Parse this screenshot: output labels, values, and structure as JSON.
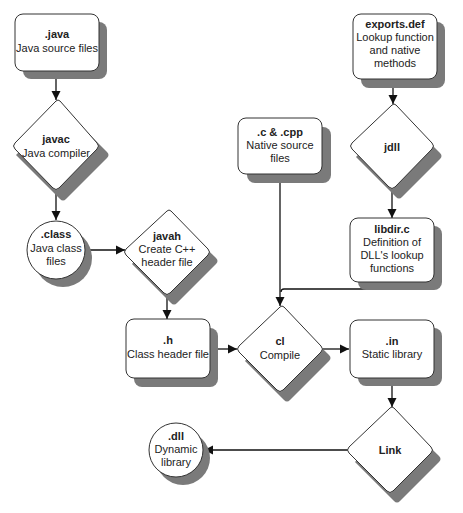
{
  "diagram": {
    "type": "flowchart",
    "colors": {
      "shape_fill": "#ffffff",
      "shape_stroke": "#333333",
      "shadow": "#7a7a7a",
      "edge": "#111111",
      "text": "#222222"
    },
    "nodes": {
      "java": {
        "shape": "rounded-rect",
        "title": ".java",
        "lines": [
          "Java source files"
        ]
      },
      "javac": {
        "shape": "diamond",
        "title": "javac",
        "lines": [
          "Java compiler"
        ]
      },
      "class": {
        "shape": "circle",
        "title": ".class",
        "lines": [
          "Java class",
          "files"
        ]
      },
      "javah": {
        "shape": "diamond",
        "title": "javah",
        "lines": [
          "Create C++",
          "header file"
        ]
      },
      "h": {
        "shape": "rounded-rect",
        "title": ".h",
        "lines": [
          "Class header file"
        ]
      },
      "cpp": {
        "shape": "rounded-rect",
        "title": ".c & .cpp",
        "lines": [
          "Native source",
          "files"
        ]
      },
      "exports": {
        "shape": "rounded-rect",
        "title": "exports.def",
        "lines": [
          "Lookup function",
          "and native",
          "methods"
        ]
      },
      "jdll": {
        "shape": "diamond",
        "title": "jdll",
        "lines": []
      },
      "libdir": {
        "shape": "rounded-rect",
        "title": "libdir.c",
        "lines": [
          "Definition of",
          "DLL's lookup",
          "functions"
        ]
      },
      "cl": {
        "shape": "diamond",
        "title": "cl",
        "lines": [
          "Compile"
        ]
      },
      "in": {
        "shape": "rounded-rect",
        "title": ".in",
        "lines": [
          "Static library"
        ]
      },
      "link": {
        "shape": "diamond",
        "title": "Link",
        "lines": []
      },
      "dll": {
        "shape": "circle",
        "title": ".dll",
        "lines": [
          "Dynamic",
          "library"
        ]
      }
    },
    "edges": [
      {
        "from": "java",
        "to": "javac"
      },
      {
        "from": "javac",
        "to": "class"
      },
      {
        "from": "class",
        "to": "javah"
      },
      {
        "from": "javah",
        "to": "h"
      },
      {
        "from": "h",
        "to": "cl"
      },
      {
        "from": "cpp",
        "to": "cl"
      },
      {
        "from": "exports",
        "to": "jdll"
      },
      {
        "from": "jdll",
        "to": "libdir"
      },
      {
        "from": "libdir",
        "to": "cl"
      },
      {
        "from": "cl",
        "to": "in"
      },
      {
        "from": "in",
        "to": "link"
      },
      {
        "from": "link",
        "to": "dll"
      }
    ]
  }
}
